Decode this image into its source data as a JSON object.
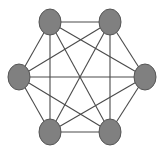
{
  "diagram": {
    "type": "complete-graph",
    "name": "K6",
    "colors": {
      "node_fill": "#808080",
      "node_stroke": "#555555",
      "edge": "#4a4a4a",
      "background": "#ffffff"
    },
    "nodes": [
      {
        "id": "top-left",
        "cx": 50,
        "cy": 22
      },
      {
        "id": "top-right",
        "cx": 110,
        "cy": 22
      },
      {
        "id": "middle-right",
        "cx": 145,
        "cy": 77
      },
      {
        "id": "bottom-right",
        "cx": 110,
        "cy": 132
      },
      {
        "id": "bottom-left",
        "cx": 50,
        "cy": 132
      },
      {
        "id": "middle-left",
        "cx": 19,
        "cy": 77
      }
    ],
    "node_radius": {
      "rx": 11,
      "ry": 13
    },
    "edges": "all pairs (15)"
  }
}
